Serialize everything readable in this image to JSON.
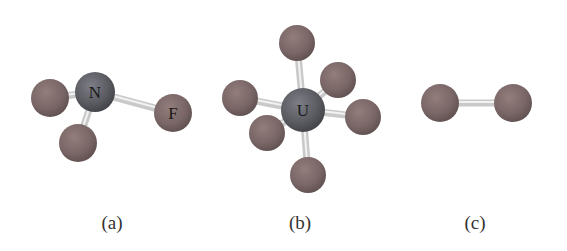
{
  "figure": {
    "colors": {
      "background": "#ffffff",
      "central_atom": "#5c5d63",
      "fluorine_atom": "#7b6767",
      "bond": "#c9c9c9",
      "bond_highlight": "#f2f2f2",
      "label": "#333333"
    },
    "molecules": [
      {
        "id": "a",
        "caption": "(a)",
        "caption_pos": [
          112,
          229
        ],
        "atoms": [
          {
            "symbol": "",
            "type": "F",
            "x": 50,
            "y": 98,
            "r": 19
          },
          {
            "symbol": "",
            "type": "F",
            "x": 78,
            "y": 143,
            "r": 19
          },
          {
            "symbol": "N",
            "type": "central",
            "x": 95,
            "y": 92,
            "r": 20
          },
          {
            "symbol": "F",
            "type": "F",
            "x": 173,
            "y": 113,
            "r": 19
          }
        ],
        "bonds": [
          [
            2,
            0
          ],
          [
            2,
            1
          ],
          [
            2,
            3
          ]
        ]
      },
      {
        "id": "b",
        "caption": "(b)",
        "caption_pos": [
          300,
          229
        ],
        "atoms": [
          {
            "symbol": "",
            "type": "F",
            "x": 297,
            "y": 43,
            "r": 18
          },
          {
            "symbol": "",
            "type": "F",
            "x": 338,
            "y": 80,
            "r": 18
          },
          {
            "symbol": "",
            "type": "F",
            "x": 240,
            "y": 98,
            "r": 18
          },
          {
            "symbol": "U",
            "type": "central",
            "x": 303,
            "y": 110,
            "r": 22
          },
          {
            "symbol": "",
            "type": "F",
            "x": 363,
            "y": 117,
            "r": 18
          },
          {
            "symbol": "",
            "type": "F",
            "x": 267,
            "y": 133,
            "r": 18
          },
          {
            "symbol": "",
            "type": "F",
            "x": 308,
            "y": 175,
            "r": 18
          }
        ],
        "bonds": [
          [
            3,
            0
          ],
          [
            3,
            1
          ],
          [
            3,
            2
          ],
          [
            3,
            4
          ],
          [
            3,
            5
          ],
          [
            3,
            6
          ]
        ]
      },
      {
        "id": "c",
        "caption": "(c)",
        "caption_pos": [
          475,
          229
        ],
        "atoms": [
          {
            "symbol": "",
            "type": "F",
            "x": 440,
            "y": 103,
            "r": 19
          },
          {
            "symbol": "",
            "type": "F",
            "x": 513,
            "y": 103,
            "r": 19
          }
        ],
        "bonds": [
          [
            0,
            1
          ]
        ]
      }
    ]
  }
}
